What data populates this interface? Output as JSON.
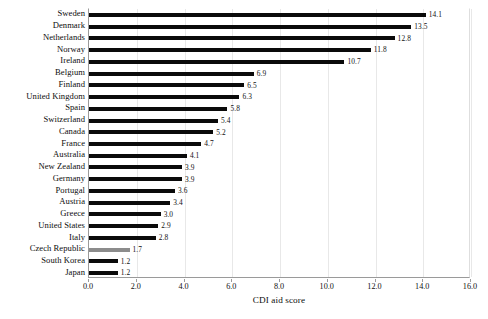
{
  "chart_data": {
    "type": "bar",
    "orientation": "horizontal",
    "title": "",
    "subtitle": "",
    "xlabel": "CDI aid score",
    "ylabel": "",
    "xlim": [
      0.0,
      16.0
    ],
    "xticks": [
      "0.0",
      "2.0",
      "4.0",
      "6.0",
      "8.0",
      "10.0",
      "12.0",
      "14.0",
      "16.0"
    ],
    "xtick_values": [
      0,
      2,
      4,
      6,
      8,
      10,
      12,
      14,
      16
    ],
    "grid": "vertical",
    "legend": "none",
    "categories": [
      "Sweden",
      "Denmark",
      "Netherlands",
      "Norway",
      "Ireland",
      "Belgium",
      "Finland",
      "United Kingdom",
      "Spain",
      "Switzerland",
      "Canada",
      "France",
      "Australia",
      "New Zealand",
      "Germany",
      "Portugal",
      "Austria",
      "Greece",
      "United States",
      "Italy",
      "Czech Republic",
      "South Korea",
      "Japan"
    ],
    "values": [
      14.1,
      13.5,
      12.8,
      11.8,
      10.7,
      6.9,
      6.5,
      6.3,
      5.8,
      5.4,
      5.2,
      4.7,
      4.1,
      3.9,
      3.9,
      3.6,
      3.4,
      3.0,
      2.9,
      2.8,
      1.7,
      1.2,
      1.2
    ],
    "value_labels": [
      "14.1",
      "13.5",
      "12.8",
      "11.8",
      "10.7",
      "6.9",
      "6.5",
      "6.3",
      "5.8",
      "5.4",
      "5.2",
      "4.7",
      "4.1",
      "3.9",
      "3.9",
      "3.6",
      "3.4",
      "3.0",
      "2.9",
      "2.8",
      "1.7",
      "1.2",
      "1.2"
    ],
    "bar_colors": [
      "#0a0a0a",
      "#0a0a0a",
      "#0a0a0a",
      "#0a0a0a",
      "#0a0a0a",
      "#0a0a0a",
      "#0a0a0a",
      "#0a0a0a",
      "#0a0a0a",
      "#0a0a0a",
      "#0a0a0a",
      "#0a0a0a",
      "#0a0a0a",
      "#0a0a0a",
      "#0a0a0a",
      "#0a0a0a",
      "#0a0a0a",
      "#0a0a0a",
      "#0a0a0a",
      "#0a0a0a",
      "#8c8c8c",
      "#0a0a0a",
      "#0a0a0a"
    ],
    "highlighted_category": "Czech Republic",
    "colors": {
      "bar_default": "#0a0a0a",
      "bar_highlight": "#8c8c8c",
      "gridline": "#e8e8e8",
      "axis": "#9a9a9a",
      "background": "#ffffff",
      "text": "#111111"
    }
  }
}
